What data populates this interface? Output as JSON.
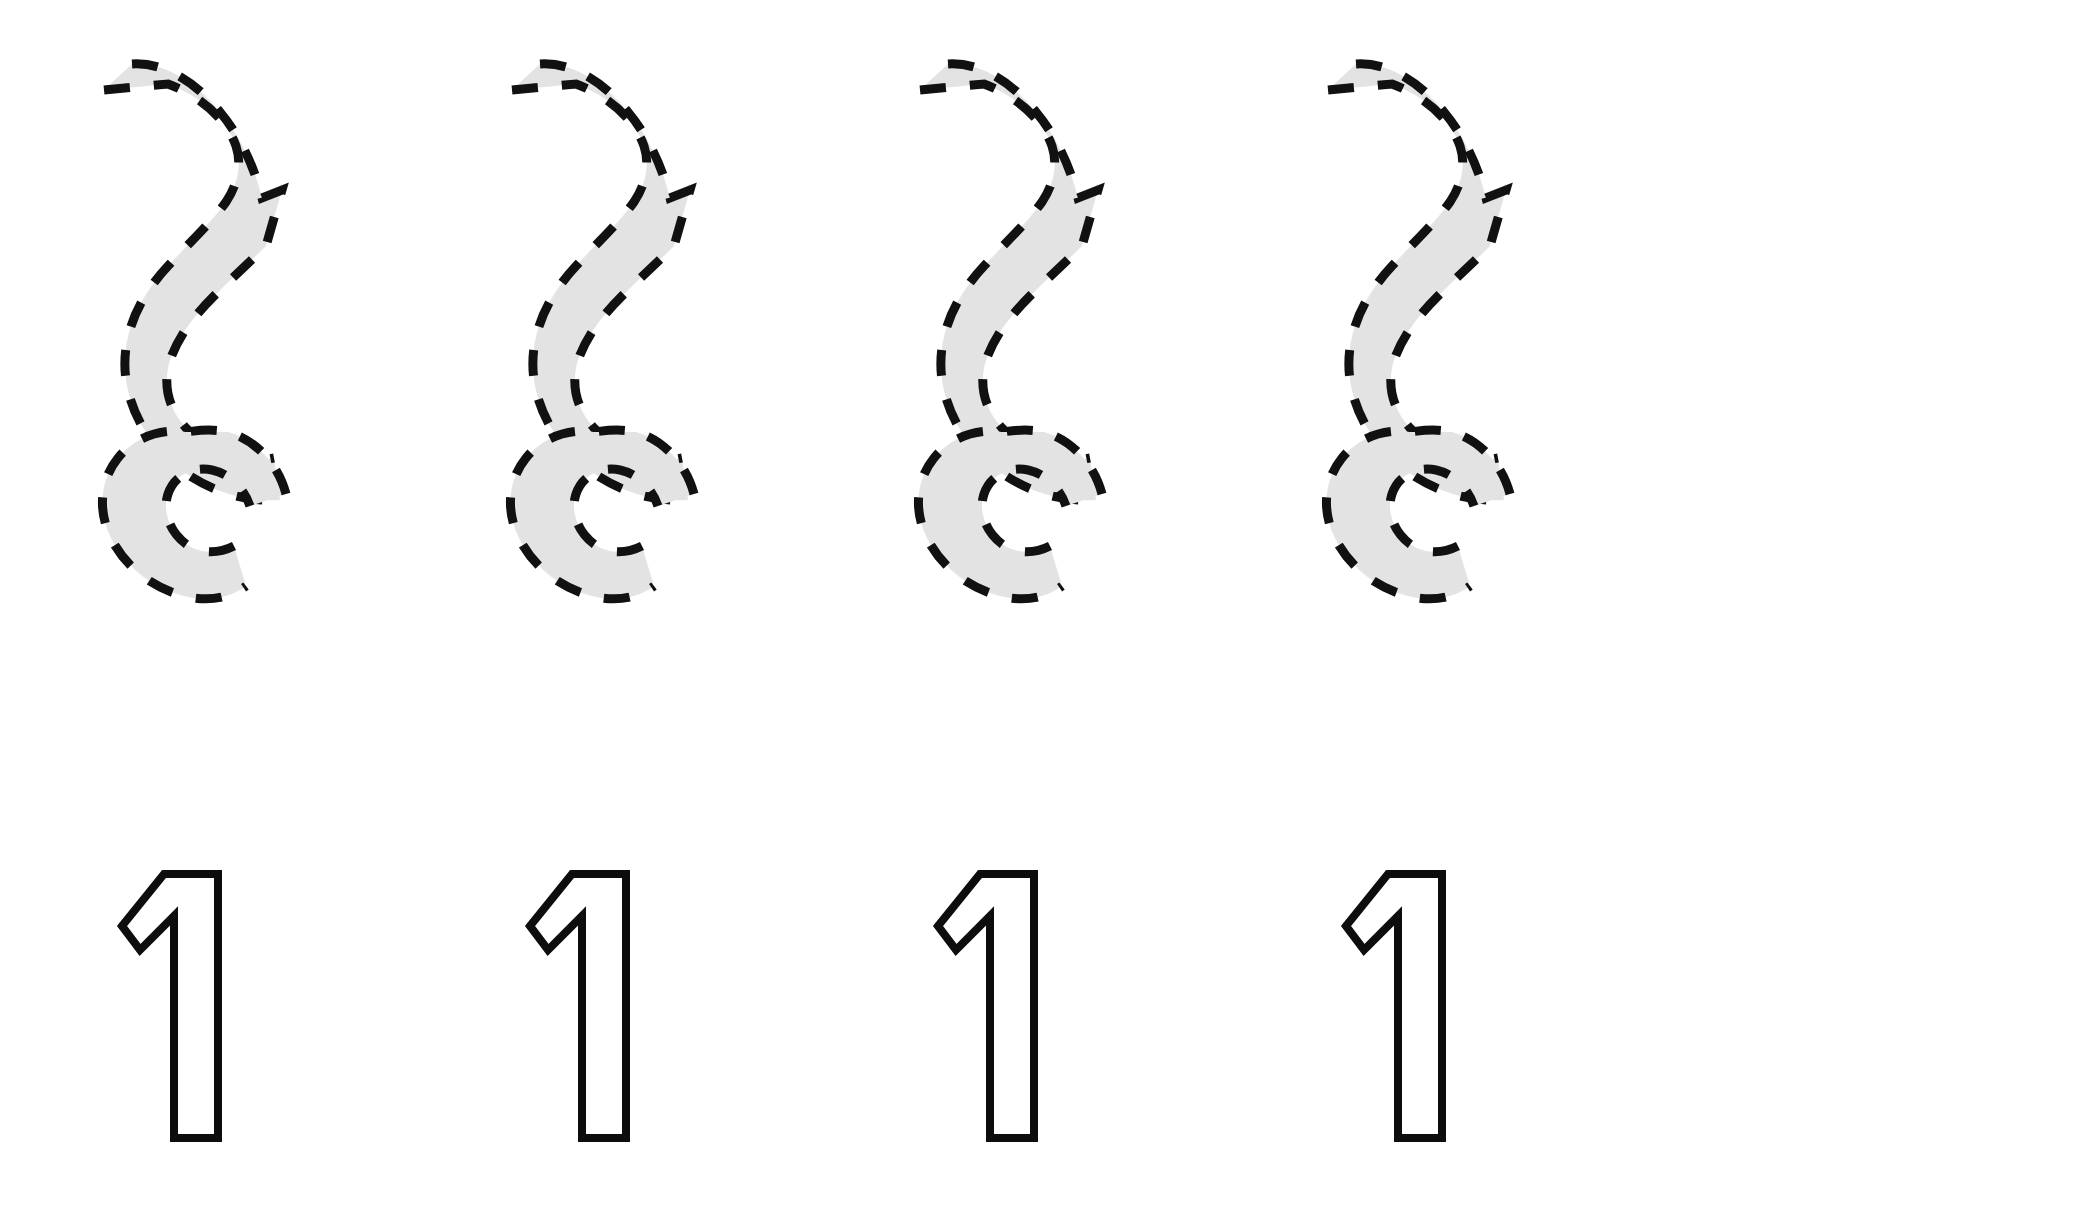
{
  "page": {
    "kind": "handwriting-tracing-worksheet",
    "background_color": "#ffffff",
    "width": 2081,
    "height": 1225
  },
  "style": {
    "trace_fill_color": "#e3e3e3",
    "trace_dash_color": "#111111",
    "numeral_stroke_color": "#0d0d0d",
    "numeral_fill_color": "#ffffff",
    "dash_pattern": "26 24",
    "dash_stroke_width": 9,
    "numeral_stroke_width": 8
  },
  "rows": [
    {
      "name": "trace-row",
      "label": "Dashed outline tracing glyphs",
      "glyph_character": "1",
      "glyph_style": "ornate-script-one",
      "count": 4,
      "items": [
        {
          "index": 1,
          "x": 90,
          "y": 50,
          "label": "1"
        },
        {
          "index": 2,
          "x": 498,
          "y": 50,
          "label": "1"
        },
        {
          "index": 3,
          "x": 906,
          "y": 50,
          "label": "1"
        },
        {
          "index": 4,
          "x": 1314,
          "y": 50,
          "label": "1"
        }
      ]
    },
    {
      "name": "numeral-row",
      "label": "Hollow outline numerals",
      "glyph_character": "1",
      "glyph_style": "block-outline-one",
      "count": 4,
      "items": [
        {
          "index": 1,
          "x": 108,
          "y": 860,
          "label": "1"
        },
        {
          "index": 2,
          "x": 516,
          "y": 860,
          "label": "1"
        },
        {
          "index": 3,
          "x": 924,
          "y": 860,
          "label": "1"
        },
        {
          "index": 4,
          "x": 1332,
          "y": 860,
          "label": "1"
        }
      ]
    }
  ],
  "geometry": {
    "trace_glyph_path": "M 40,18 C 78,30 112,62 140,104 C 152,122 162,140 172,156 L 196,148 L 176,190 C 162,206 146,222 128,236 C 100,258 72,278 48,300 L 14,238 C 44,214 74,188 98,158 C 112,140 120,120 118,100 C 114,72 92,46 60,30 Z",
    "trace_glyph_viewbox": "0 0 220 560",
    "numeral_path": "M 12,62 L 52,16 L 104,16 L 104,278 L 62,278 L 62,56 L 30,84 Z",
    "numeral_viewbox": "0 0 120 290"
  }
}
